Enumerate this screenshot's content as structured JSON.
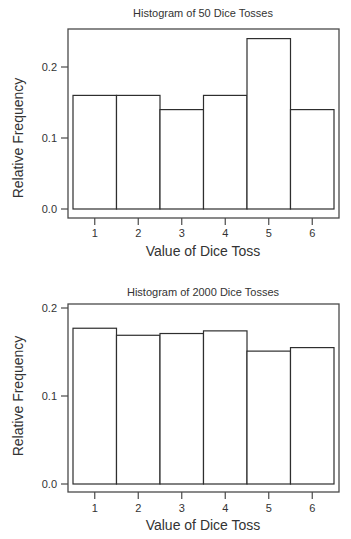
{
  "chart_data": [
    {
      "type": "bar",
      "title": "Histogram of 50 Dice Tosses",
      "xlabel": "Value of Dice Toss",
      "ylabel": "Relative Frequency",
      "categories": [
        "1",
        "2",
        "3",
        "4",
        "5",
        "6"
      ],
      "values": [
        0.16,
        0.16,
        0.14,
        0.16,
        0.24,
        0.14
      ],
      "yticks": [
        "0.0",
        "0.1",
        "0.2"
      ],
      "ytick_values": [
        0.0,
        0.1,
        0.2
      ],
      "ylim": [
        0,
        0.25
      ],
      "grid": false,
      "legend": null
    },
    {
      "type": "bar",
      "title": "Histogram of 2000 Dice Tosses",
      "xlabel": "Value of Dice Toss",
      "ylabel": "Relative Frequency",
      "categories": [
        "1",
        "2",
        "3",
        "4",
        "5",
        "6"
      ],
      "values": [
        0.177,
        0.169,
        0.171,
        0.174,
        0.151,
        0.155
      ],
      "yticks": [
        "0.0",
        "0.1",
        "0.2"
      ],
      "ytick_values": [
        0.0,
        0.1,
        0.2
      ],
      "ylim": [
        0,
        0.205
      ],
      "grid": false,
      "legend": null
    }
  ],
  "colors": {
    "bar_fill": "#ffffff",
    "bar_stroke": "#2e2e2e",
    "frame": "#4a4a4a",
    "text": "#333333"
  }
}
